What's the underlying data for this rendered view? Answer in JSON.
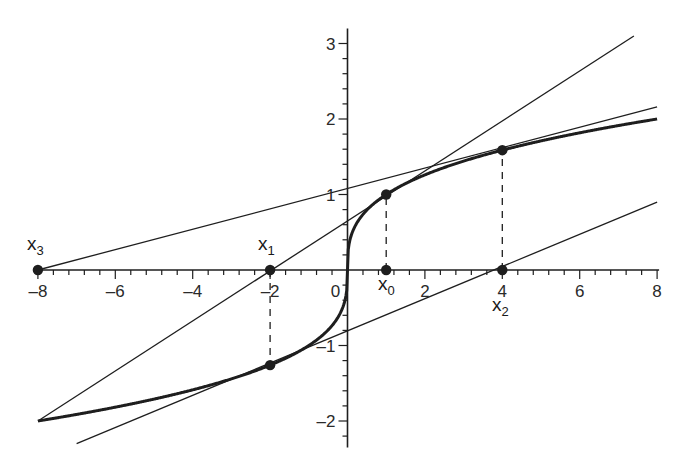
{
  "chart_data": {
    "type": "line",
    "title": "",
    "xlabel": "",
    "ylabel": "",
    "xlim": [
      -8,
      8
    ],
    "ylim": [
      -2.4,
      3.2
    ],
    "grid": false,
    "legend": null,
    "x_ticks": [
      -8,
      -6,
      -4,
      -2,
      0,
      2,
      4,
      6,
      8
    ],
    "x_tick_labels": [
      "–8",
      "–6",
      "–4",
      "–2",
      "0",
      "2",
      "4",
      "6",
      "8"
    ],
    "y_ticks": [
      -2,
      -1,
      1,
      2,
      3
    ],
    "y_tick_labels": [
      "–2",
      "–1",
      "1",
      "2",
      "3"
    ],
    "series": [
      {
        "name": "curve y = x^(1/3)",
        "style": "thick",
        "function": "cbrt",
        "x_range": [
          -8,
          8
        ]
      },
      {
        "name": "tangent at x0 = 1",
        "style": "thin",
        "x": [
          -8,
          7.4
        ],
        "y": [
          -2,
          3.1
        ]
      },
      {
        "name": "tangent at x1 = -2",
        "style": "thin",
        "x": [
          -7,
          8
        ],
        "y": [
          -2.3,
          0.9
        ]
      },
      {
        "name": "tangent at x2 = 4",
        "style": "thin",
        "x": [
          -8,
          8
        ],
        "y": [
          0,
          2.16
        ]
      }
    ],
    "points": [
      {
        "label": "x0",
        "x": 1,
        "y": 1
      },
      {
        "label": "x0",
        "x": 1,
        "y": 0
      },
      {
        "label": "x1",
        "x": -2,
        "y": 0
      },
      {
        "label": "x1",
        "x": -2,
        "y": -1.26
      },
      {
        "label": "x2",
        "x": 4,
        "y": 0
      },
      {
        "label": "x2",
        "x": 4,
        "y": 1.587
      },
      {
        "label": "x3",
        "x": -8,
        "y": 0
      }
    ],
    "dashed_verticals": [
      {
        "x": 1,
        "y_from": 0,
        "y_to": 1
      },
      {
        "x": -2,
        "y_from": 0,
        "y_to": -1.26
      },
      {
        "x": 4,
        "y_from": 0,
        "y_to": 1.587
      }
    ],
    "annotations": [
      {
        "text": "x",
        "sub": "3",
        "x": -8,
        "y": 0,
        "position": "above"
      },
      {
        "text": "x",
        "sub": "1",
        "x": -2,
        "y": 0,
        "position": "above"
      },
      {
        "text": "x",
        "sub": "0",
        "x": 1,
        "y": 0,
        "position": "below"
      },
      {
        "text": "x",
        "sub": "2",
        "x": 4,
        "y": 0,
        "position": "below"
      }
    ]
  },
  "labels": {
    "x3": {
      "main": "x",
      "sub": "3"
    },
    "x1": {
      "main": "x",
      "sub": "1"
    },
    "x0": {
      "main": "x",
      "sub": "0"
    },
    "x2": {
      "main": "x",
      "sub": "2"
    }
  },
  "colors": {
    "ink": "#1e1e1e",
    "axis": "#2a2a2a",
    "background": "#ffffff"
  }
}
